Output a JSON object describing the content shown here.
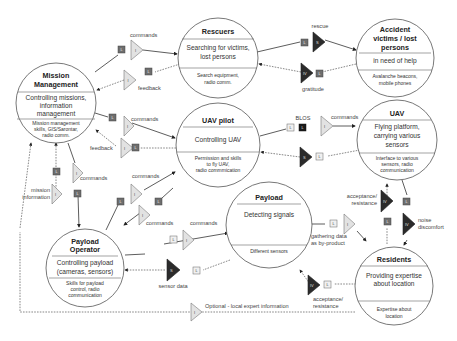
{
  "nodes": {
    "mission": {
      "title1": "Mission",
      "title2": "Management",
      "main1": "Controlling missions,",
      "main2": "information",
      "main3": "management",
      "sub1": "Mission management",
      "sub2": "skills, GIS/Sarontar,",
      "sub3": "radio comm."
    },
    "rescuers": {
      "title": "Rescuers",
      "main1": "Searching for victims,",
      "main2": "lost persons",
      "sub1": "Search equipment,",
      "sub2": "radio comm."
    },
    "victims": {
      "title1": "Accident",
      "title2": "victims / lost",
      "title3": "persons",
      "main": "in need of help",
      "sub1": "Avalanche beacons,",
      "sub2": "mobile phones"
    },
    "pilot": {
      "title": "UAV pilot",
      "main": "Controlling UAV",
      "sub1": "Permission and skills",
      "sub2": "to fly UAV,",
      "sub3": "radio commmication"
    },
    "uav": {
      "title": "UAV",
      "main1": "Flying platform,",
      "main2": "carrying various",
      "main3": "sensors",
      "sub1": "Interface to various",
      "sub2": "sensors, radio",
      "sub3": "communication"
    },
    "payload": {
      "title": "Payload",
      "main": "Detecting signals",
      "sub": "Different sensors"
    },
    "operator": {
      "title1": "Payload",
      "title2": "Operator",
      "main1": "Controlling payload",
      "main2": "(cameras, sensors)",
      "sub1": "Skills for payload",
      "sub2": "control, radio",
      "sub3": "communication"
    },
    "residents": {
      "title": "Residents",
      "main1": "Providing expertise",
      "main2": "about location",
      "sub1": "Expertise about",
      "sub2": "location"
    }
  },
  "labels": {
    "commands": "commands",
    "feedback": "feedback",
    "rescue": "rescue",
    "gratitude": "gratitude",
    "blos": "BLOS",
    "mission_information1": "mission",
    "mission_information2": "information",
    "sensor_data": "sensor data",
    "gathering1": "gathering data",
    "gathering2": "as by-product",
    "acceptance1": "acceptance/",
    "acceptance2": "resistance",
    "noise1": "noise",
    "noise2": "discomfort",
    "optional": "Optional - local expert information"
  },
  "glyphs": {
    "L": "L",
    "I": "I",
    "S": "S",
    "IV": "IV"
  },
  "colors": {
    "line": "#333333",
    "dark_glyph": "#2b2b2b",
    "light_glyph": "#e2e2e2",
    "square_dark": "#6e6e6e",
    "square_black": "#1a1a1a"
  }
}
